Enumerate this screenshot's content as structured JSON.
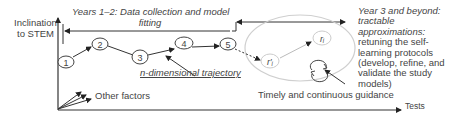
{
  "axes": {
    "y_label_line1": "Inclination",
    "y_label_line2": "to STEM",
    "x_label": "Tests"
  },
  "phases": {
    "phase1": {
      "line1": "Years 1–2: Data collection and model",
      "line2": "fitting"
    },
    "phase2": {
      "title": "Year 3 and beyond:",
      "subtitle_line1": "tractable",
      "subtitle_line2": "approximations:",
      "desc_line1": "retuning the self-",
      "desc_line2": "learning protocols",
      "desc_line3": "(develop, refine, and",
      "desc_line4": "validate the study",
      "desc_line5": "models)"
    }
  },
  "trajectory": {
    "label": "n-dimensional trajectory",
    "nodes": [
      "1",
      "2",
      "3",
      "4",
      "5"
    ]
  },
  "cycle": {
    "node_a": "r′ᵢ",
    "node_b": "rᵢ"
  },
  "other_factors_label": "Other factors",
  "guidance_label": "Timely and continuous guidance",
  "colors": {
    "line": "#333333",
    "ellipse": "#cfcfcf",
    "text": "#444444"
  }
}
